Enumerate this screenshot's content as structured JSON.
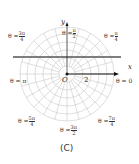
{
  "caption": "(C)",
  "axes": {
    "x": "x",
    "y": "y",
    "origin": "O",
    "tick": "2"
  },
  "angles": [
    {
      "id": "pi2",
      "prefix": "θ =",
      "num": "π",
      "den": "2"
    },
    {
      "id": "3pi4",
      "prefix": "θ =",
      "num": "3π",
      "den": "4"
    },
    {
      "id": "pi4",
      "prefix": "θ =",
      "num": "π",
      "den": "4"
    },
    {
      "id": "pi",
      "prefix": "θ = π"
    },
    {
      "id": "0",
      "prefix": "θ = 0"
    },
    {
      "id": "5pi4",
      "prefix": "θ =",
      "num": "5π",
      "den": "4"
    },
    {
      "id": "7pi4",
      "prefix": "θ =",
      "num": "7π",
      "den": "4"
    },
    {
      "id": "3pi2",
      "prefix": "θ =",
      "num": "3π",
      "den": "2"
    }
  ],
  "colors": {
    "grid": "#c8c8c8",
    "line": "#555555",
    "arrow": "#111111"
  }
}
